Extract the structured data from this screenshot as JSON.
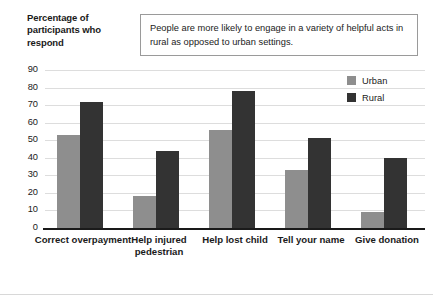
{
  "y_axis_title": "Percentage of participants who respond",
  "annotation": "People are more likely to engage in a variety of helpful acts in rural as opposed to urban settings.",
  "legend": {
    "entries": [
      {
        "label": "Urban",
        "color": "#8e8e8e"
      },
      {
        "label": "Rural",
        "color": "#333333"
      }
    ]
  },
  "chart_data": {
    "type": "bar",
    "title": "",
    "xlabel": "",
    "ylabel": "Percentage of participants who respond",
    "ylim": [
      0,
      90
    ],
    "yticks": [
      0,
      10,
      20,
      30,
      40,
      50,
      60,
      70,
      80,
      90
    ],
    "ytick_labels": [
      "0",
      "10",
      "20",
      "30",
      "40",
      "50",
      "60",
      "70",
      "80",
      "90"
    ],
    "grid": true,
    "legend_position": "top-right",
    "categories": [
      "Correct overpayment",
      "Help injured pedestrian",
      "Help lost child",
      "Tell your name",
      "Give donation"
    ],
    "series": [
      {
        "name": "Urban",
        "color": "#8e8e8e",
        "values": [
          53,
          18,
          56,
          33,
          9
        ]
      },
      {
        "name": "Rural",
        "color": "#333333",
        "values": [
          72,
          44,
          78,
          51,
          40
        ]
      }
    ]
  }
}
